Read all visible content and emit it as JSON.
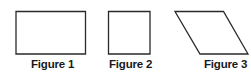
{
  "figures": [
    {
      "label": "Figure 1",
      "shape": "rectangle",
      "points": "16,11.5 85.5,11.5 85.5,54 16,54"
    },
    {
      "label": "Figure 2",
      "shape": "square",
      "points": "108.5,11.5 150,11.5 150,54 108.5,54"
    },
    {
      "label": "Figure 3",
      "shape": "parallelogram",
      "points": "175,11.5 223.5,11.5 248,54 200,54"
    }
  ],
  "colors": {
    "stroke": "#2a2a2a",
    "background": "#ffffff",
    "label": "#1a1a1a"
  }
}
